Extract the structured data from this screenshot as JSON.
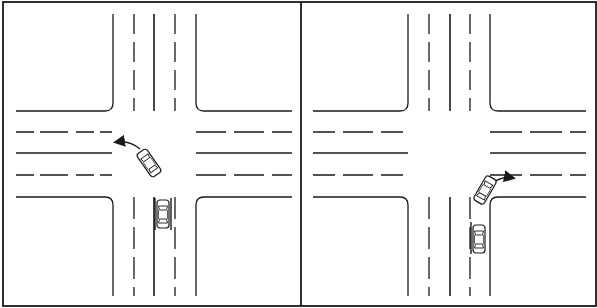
{
  "figure": {
    "colors": {
      "ink": "#1a1a1a",
      "paper": "#ffffff"
    },
    "panels": [
      {
        "id": "left",
        "label": "left-turn-maneuver",
        "maneuver": "left turn",
        "cars": [
          {
            "role": "turning-car",
            "x": 148,
            "y": 162,
            "angle": -35
          },
          {
            "role": "waiting-car",
            "x": 162,
            "y": 214,
            "angle": 0
          }
        ],
        "arrow": {
          "direction": "left",
          "path": "M140 150 Q128 140 112 142"
        }
      },
      {
        "id": "right",
        "label": "right-turn-maneuver",
        "maneuver": "right turn",
        "cars": [
          {
            "role": "turning-car",
            "x": 485,
            "y": 190,
            "angle": 30
          },
          {
            "role": "waiting-car",
            "x": 479,
            "y": 239,
            "angle": 0
          }
        ],
        "arrow": {
          "direction": "right",
          "path": "M492 182 Q502 175 514 177"
        }
      }
    ]
  }
}
